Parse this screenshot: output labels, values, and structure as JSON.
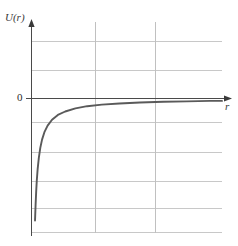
{
  "figure": {
    "kind": "physics-potential-energy-plot",
    "background_color": "#ffffff"
  },
  "labels": {
    "y_axis": "U(r)",
    "x_axis": "r",
    "origin": "0"
  },
  "colors": {
    "curve": "#5a5a5a",
    "axis": "#4a4a4a",
    "grid": "#c8c8c8"
  },
  "chart_data": {
    "type": "line",
    "title": "",
    "xlabel": "r",
    "ylabel": "U(r)",
    "grid": true,
    "legend_position": "none",
    "xlim": [
      0,
      6.5
    ],
    "ylim": [
      -4.6,
      2.6
    ],
    "annotations": [
      {
        "text": "U(r)",
        "role": "y-axis-label"
      },
      {
        "text": "r",
        "role": "x-axis-label"
      },
      {
        "text": "0",
        "role": "origin-tick-label"
      }
    ],
    "x_gridlines": [
      2,
      4
    ],
    "y_gridlines": [
      2,
      1,
      0,
      -0.8,
      -1.8,
      -2.8,
      -3.7,
      -4.6
    ],
    "series": [
      {
        "name": "U(r) = -k/r",
        "x": [
          0.12,
          0.14,
          0.16,
          0.18,
          0.21,
          0.25,
          0.3,
          0.36,
          0.44,
          0.55,
          0.7,
          0.9,
          1.15,
          1.5,
          1.9,
          2.4,
          3.0,
          3.7,
          4.5,
          5.3,
          6.1,
          6.5
        ],
        "y": [
          -4.6,
          -4.0,
          -3.5,
          -3.1,
          -2.66,
          -2.24,
          -1.86,
          -1.55,
          -1.27,
          -1.02,
          -0.8,
          -0.62,
          -0.49,
          -0.37,
          -0.29,
          -0.23,
          -0.19,
          -0.15,
          -0.12,
          -0.11,
          -0.09,
          -0.09
        ]
      }
    ]
  }
}
